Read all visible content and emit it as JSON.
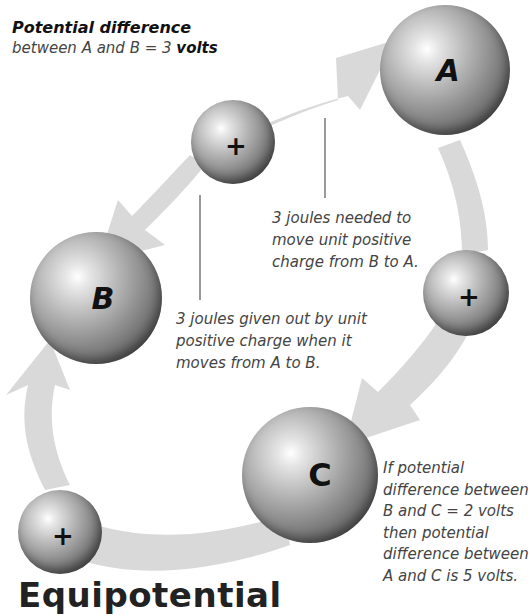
{
  "header": {
    "title": "Potential difference",
    "subtitle_prefix": "between A and B = 3 ",
    "subtitle_bold": "volts"
  },
  "spheres": {
    "A": {
      "label": "A"
    },
    "B": {
      "label": "B"
    },
    "C": {
      "label": "C"
    },
    "charge_symbol": "+"
  },
  "annotations": {
    "needed": [
      "3 joules needed to",
      "move unit positive",
      "charge from B to A."
    ],
    "given_out": [
      "3 joules given out by unit",
      "positive charge when it",
      "moves from A to B."
    ],
    "c_note": [
      "If potential",
      "difference between",
      "B and C = 2 volts",
      "then potential",
      "difference between",
      "A and C is 5 volts."
    ]
  },
  "footer": {
    "heading": "Equipotential"
  },
  "colors": {
    "arrow": "#d9d9d9",
    "text": "#444444",
    "heading": "#222222"
  }
}
